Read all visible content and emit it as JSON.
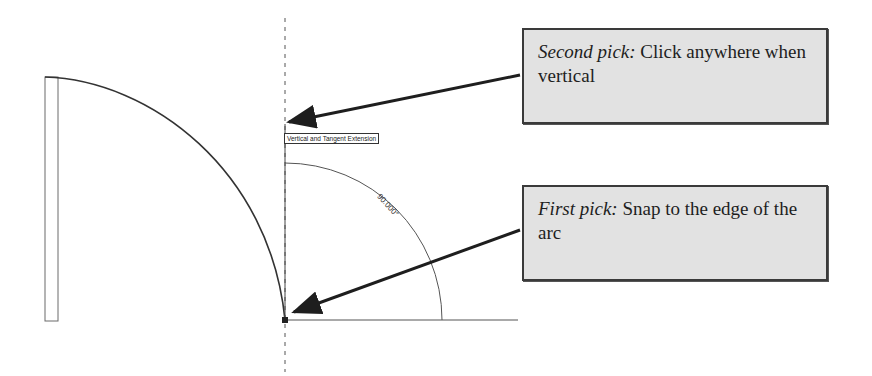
{
  "diagram": {
    "type": "cad-arc-extension-instructions",
    "callouts": {
      "second_pick": {
        "lead": "Second pick:",
        "text": " Click anywhere when vertical"
      },
      "first_pick": {
        "lead": "First pick:",
        "text": " Snap to the edge of the arc"
      }
    },
    "snap_tooltip": "Vertical and Tangent Extension",
    "angle_dimension": "90.000°",
    "colors": {
      "callout_fill": "#e2e2e2",
      "callout_border": "#3a3a3a",
      "line": "#333333",
      "arrow": "#222222",
      "background": "#ffffff"
    }
  }
}
